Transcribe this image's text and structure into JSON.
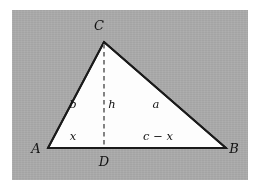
{
  "figure": {
    "kind": "triangle-altitude-diagram",
    "background_color": "#ffffff",
    "panel_color": "#a9a9a9",
    "triangle_fill": "#fdfdfd",
    "stroke_color": "#1a1a1a",
    "dash_color": "#7d7d7d"
  },
  "vertices": {
    "A": {
      "label": "A",
      "x": 48,
      "y": 148
    },
    "B": {
      "label": "B",
      "x": 226,
      "y": 148
    },
    "C": {
      "label": "C",
      "x": 104,
      "y": 42
    },
    "D": {
      "label": "D",
      "x": 104,
      "y": 148
    }
  },
  "vertex_labels": {
    "A": {
      "text": "A",
      "x": 36,
      "y": 153
    },
    "B": {
      "text": "B",
      "x": 233,
      "y": 153
    },
    "C": {
      "text": "C",
      "x": 99,
      "y": 30
    },
    "D": {
      "text": "D",
      "x": 99,
      "y": 165
    }
  },
  "side_labels": {
    "b": {
      "text": "b",
      "x": 73,
      "y": 107
    },
    "h": {
      "text": "h",
      "x": 110,
      "y": 107
    },
    "a": {
      "text": "a",
      "x": 155,
      "y": 107
    },
    "x": {
      "text": "x",
      "x": 72,
      "y": 139
    },
    "c_x": {
      "text": "c − x",
      "x": 147,
      "y": 139
    }
  },
  "segments": {
    "side_b": {
      "from": "A",
      "to": "C",
      "style": "solid"
    },
    "side_a": {
      "from": "C",
      "to": "B",
      "style": "solid"
    },
    "base_c": {
      "from": "A",
      "to": "B",
      "style": "solid"
    },
    "altitude_h": {
      "from": "C",
      "to": "D",
      "style": "dashed"
    }
  }
}
